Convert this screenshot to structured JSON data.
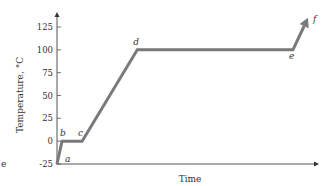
{
  "chart_data": {
    "type": "line",
    "title": "",
    "xlabel": "Time",
    "ylabel": "Temperature, °C",
    "ylim": [
      -25,
      135
    ],
    "yticks": [
      -25,
      0,
      25,
      50,
      75,
      100,
      125
    ],
    "ytick_labels": [
      "-25",
      "0",
      "25",
      "50",
      "75",
      "100",
      "125"
    ],
    "grid": false,
    "legend": null,
    "series": [
      {
        "name": "heating curve",
        "points": [
          {
            "label": "a",
            "x": 0,
            "y": -25
          },
          {
            "label": "b",
            "x": 2,
            "y": 0
          },
          {
            "label": "c",
            "x": 10,
            "y": 0
          },
          {
            "label": "d",
            "x": 32,
            "y": 100
          },
          {
            "label": "e",
            "x": 94,
            "y": 100
          },
          {
            "label": "f",
            "x": 100,
            "y": 135
          }
        ],
        "color": "#7a7a7a"
      }
    ],
    "annotations": [
      "a",
      "b",
      "c",
      "d",
      "e",
      "f"
    ]
  },
  "axes": {
    "x_title": "Time",
    "y_title": "Temperature, °C"
  },
  "stray_text": "e"
}
